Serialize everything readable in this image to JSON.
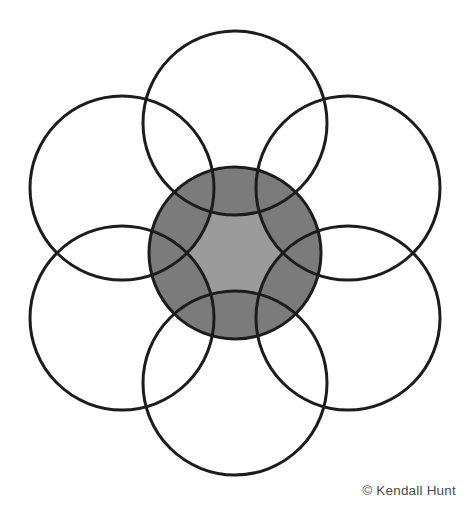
{
  "figure": {
    "type": "geometric-diagram",
    "canvas": {
      "width": 468,
      "height": 516
    },
    "background_color": "#ffffff",
    "stroke_color": "#1c1c1c",
    "stroke_width": 3,
    "center_fill_light": "#9b9b9b",
    "center_fill_dark": "#7b7b7b",
    "center": {
      "x": 235,
      "y": 253
    },
    "center_circle": {
      "name": "center-circle",
      "cx": 235,
      "cy": 253,
      "r": 86,
      "fill": "#9b9b9b"
    },
    "petal_radius": 92,
    "petal_distance": 130,
    "petals": [
      {
        "name": "petal-top",
        "angle_deg": -90,
        "cx": 235,
        "cy": 123
      },
      {
        "name": "petal-upper-right",
        "angle_deg": -30,
        "cx": 348,
        "cy": 188
      },
      {
        "name": "petal-lower-right",
        "angle_deg": 30,
        "cx": 348,
        "cy": 318
      },
      {
        "name": "petal-bottom",
        "angle_deg": 90,
        "cx": 235,
        "cy": 383
      },
      {
        "name": "petal-lower-left",
        "angle_deg": 150,
        "cx": 122,
        "cy": 318
      },
      {
        "name": "petal-upper-left",
        "angle_deg": 210,
        "cx": 122,
        "cy": 188
      }
    ]
  },
  "credit": {
    "text": "© Kendall Hunt",
    "symbol": "©",
    "publisher": "Kendall Hunt",
    "color": "#4a4a4a"
  }
}
